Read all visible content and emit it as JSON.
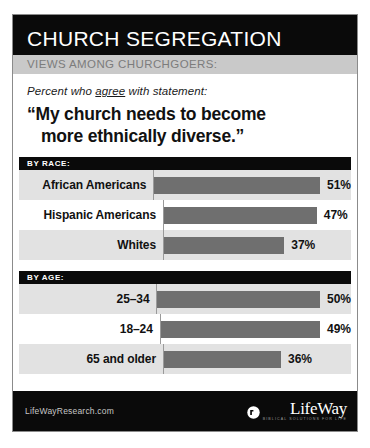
{
  "header": {
    "title": "CHURCH SEGREGATION",
    "subtitle": "VIEWS AMONG CHURCHGOERS:"
  },
  "quote_block": {
    "lede_prefix": "Percent who ",
    "lede_underlined": "agree",
    "lede_suffix": " with statement:",
    "quote_line1": "“My church needs to become",
    "quote_line2": "more ethnically diverse.”"
  },
  "footer": {
    "url": "LifeWayResearch.com",
    "logo_name": "LifeWay",
    "logo_tagline": "BIBLICAL SOLUTIONS FOR LIFE"
  },
  "colors": {
    "header_bg": "#0a0a0a",
    "subbar_bg": "#c9c9c9",
    "bar_fill": "#6f6f6f",
    "row_shade": "#e2e2e2",
    "text_dark": "#111111"
  },
  "chart_data": {
    "type": "bar",
    "title": "CHURCH SEGREGATION",
    "subtitle": "VIEWS AMONG CHURCHGOERS:",
    "question": "“My church needs to become more ethnically diverse.”",
    "measure": "Percent who agree with statement",
    "xlabel": "",
    "ylabel": "",
    "xlim": [
      0,
      60
    ],
    "grid": false,
    "legend": "none",
    "orientation": "horizontal",
    "value_suffix": "%",
    "sections": [
      {
        "band_label": "BY RACE:",
        "categories": [
          "African Americans",
          "Hispanic Americans",
          "Whites"
        ],
        "values": [
          51,
          47,
          37
        ],
        "value_labels": [
          "51%",
          "47%",
          "37%"
        ]
      },
      {
        "band_label": "BY AGE:",
        "categories": [
          "25–34",
          "18–24",
          "65 and older"
        ],
        "values": [
          50,
          49,
          36
        ],
        "value_labels": [
          "50%",
          "49%",
          "36%"
        ]
      }
    ]
  }
}
